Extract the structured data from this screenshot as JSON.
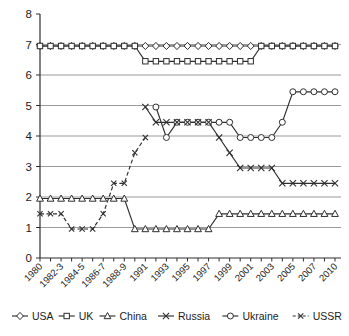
{
  "colors": {
    "line": "#2f2f2f",
    "grid": "#8f8f8f",
    "axis": "#2f2f2f",
    "text": "#1c1c1c",
    "marker_fill": "#ffffff",
    "background": "#ffffff"
  },
  "chart_data": {
    "type": "line",
    "title": "",
    "xlabel": "",
    "ylabel": "",
    "ylim": [
      0,
      8
    ],
    "y_ticks": [
      0,
      1,
      2,
      3,
      4,
      5,
      6,
      7,
      8
    ],
    "gridlines": [
      1,
      2,
      3,
      4,
      5,
      6,
      7
    ],
    "grid": "horizontal",
    "legend_position": "bottom",
    "x_tick_labels": [
      "1980",
      "",
      "1982-3",
      "",
      "1984-5",
      "",
      "1986-7",
      "",
      "1988-9",
      "",
      "1991",
      "",
      "1993",
      "",
      "1995",
      "",
      "1997",
      "",
      "1999",
      "",
      "2001",
      "",
      "2003",
      "",
      "2005",
      "",
      "2007",
      "",
      "2010"
    ],
    "series": [
      {
        "name": "USA",
        "marker": "diamond",
        "line": "solid",
        "values": [
          7,
          7,
          7,
          7,
          7,
          7,
          7,
          7,
          7,
          7,
          7,
          7,
          7,
          7,
          7,
          7,
          7,
          7,
          7,
          7,
          7,
          7,
          7,
          7,
          7,
          7,
          7,
          7,
          7
        ]
      },
      {
        "name": "UK",
        "marker": "square",
        "line": "solid",
        "values": [
          7,
          7,
          7,
          7,
          7,
          7,
          7,
          7,
          7,
          7,
          6.5,
          6.5,
          6.5,
          6.5,
          6.5,
          6.5,
          6.5,
          6.5,
          6.5,
          6.5,
          6.5,
          7,
          7,
          7,
          7,
          7,
          7,
          7,
          7
        ]
      },
      {
        "name": "China",
        "marker": "triangle",
        "line": "solid",
        "values": [
          2,
          2,
          2,
          2,
          2,
          2,
          2,
          2,
          2,
          1,
          1,
          1,
          1,
          1,
          1,
          1,
          1,
          1.5,
          1.5,
          1.5,
          1.5,
          1.5,
          1.5,
          1.5,
          1.5,
          1.5,
          1.5,
          1.5,
          1.5
        ]
      },
      {
        "name": "Russia",
        "marker": "cross",
        "line": "solid",
        "values": [
          null,
          null,
          null,
          null,
          null,
          null,
          null,
          null,
          null,
          null,
          5,
          4.5,
          4.5,
          4.5,
          4.5,
          4.5,
          4.5,
          4,
          3.5,
          3,
          3,
          3,
          3,
          2.5,
          2.5,
          2.5,
          2.5,
          2.5,
          2.5
        ]
      },
      {
        "name": "Ukraine",
        "marker": "circle",
        "line": "solid",
        "values": [
          null,
          null,
          null,
          null,
          null,
          null,
          null,
          null,
          null,
          null,
          null,
          5,
          4,
          4.5,
          4.5,
          4.5,
          4.5,
          4.5,
          4.5,
          4,
          4,
          4,
          4,
          4.5,
          5.5,
          5.5,
          5.5,
          5.5,
          5.5
        ]
      },
      {
        "name": "USSR",
        "marker": "cross-small",
        "line": "dashed",
        "values": [
          1.5,
          1.5,
          1.5,
          1,
          1,
          1,
          1.5,
          2.5,
          2.5,
          3.5,
          4,
          null,
          null,
          null,
          null,
          null,
          null,
          null,
          null,
          null,
          null,
          null,
          null,
          null,
          null,
          null,
          null,
          null,
          null
        ]
      }
    ]
  }
}
